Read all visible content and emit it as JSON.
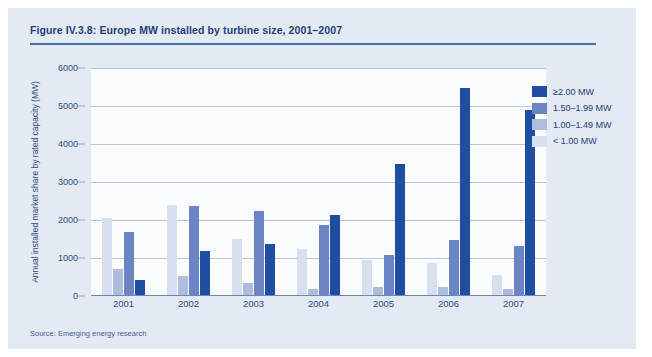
{
  "figure": {
    "title": "Figure IV.3.8: Europe MW installed by turbine size, 2001–2007",
    "source": "Source: Emerging energy research"
  },
  "colors": {
    "panel_background": "#e3eaf4",
    "plot_background": "#fbfcfe",
    "title_text": "#1f3f7a",
    "gridline": "#b9c7e2",
    "axis": "#6c86bb",
    "series_ge_2_00": "#1f4ea1",
    "series_1_50_1_99": "#6b85c4",
    "series_1_00_1_49": "#aebcdd",
    "series_lt_1_00": "#d8e0ef"
  },
  "chart_data": {
    "type": "bar",
    "title": "Figure IV.3.8: Europe MW installed by turbine size, 2001–2007",
    "xlabel": "",
    "ylabel": "Annual installed market share by rated capacity (MW)",
    "categories": [
      "2001",
      "2002",
      "2003",
      "2004",
      "2005",
      "2006",
      "2007"
    ],
    "ylim": [
      0,
      6000
    ],
    "yticks": [
      0,
      1000,
      2000,
      3000,
      4000,
      5000,
      6000
    ],
    "grid": true,
    "legend_position": "right",
    "series": [
      {
        "name": "< 1.00 MW",
        "color": "#d8e0ef",
        "values": [
          2050,
          2400,
          1500,
          1250,
          950,
          870,
          560
        ]
      },
      {
        "name": "1.00–1.49 MW",
        "color": "#aebcdd",
        "values": [
          700,
          520,
          330,
          180,
          230,
          230,
          180
        ]
      },
      {
        "name": "1.50–1.99 MW",
        "color": "#6b85c4",
        "values": [
          1680,
          2370,
          2250,
          1880,
          1080,
          1470,
          1320
        ]
      },
      {
        "name": "≥2.00 MW",
        "color": "#1f4ea1",
        "values": [
          430,
          1180,
          1360,
          2130,
          3480,
          5470,
          4900
        ]
      }
    ],
    "legend_display_order": [
      "≥2.00 MW",
      "1.50–1.99 MW",
      "1.00–1.49 MW",
      "< 1.00 MW"
    ]
  }
}
